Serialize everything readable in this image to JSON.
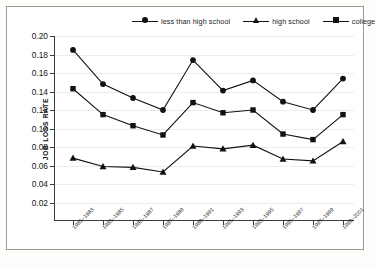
{
  "chart_data": {
    "type": "line",
    "title": "",
    "xlabel": "",
    "ylabel": "JOB LOSS RATE",
    "ylim": [
      0.0,
      0.2
    ],
    "yticks": [
      "0.02",
      "0.04",
      "0.06",
      "0.08",
      "0.10",
      "0.12",
      "0.14",
      "0.16",
      "0.18",
      "0.20"
    ],
    "ytick_values": [
      0.02,
      0.04,
      0.06,
      0.08,
      0.1,
      0.12,
      0.14,
      0.16,
      0.18,
      0.2
    ],
    "grid": true,
    "legend_position": "top",
    "categories": [
      "1981–1983",
      "1983–1985",
      "1985–1987",
      "1987–1989",
      "1989–1991",
      "1991–1993",
      "1993–1995",
      "1995–1997",
      "1997–1999",
      "1999–2001"
    ],
    "series": [
      {
        "name": "less than high school",
        "marker": "circle",
        "color": "#111111",
        "values": [
          0.185,
          0.148,
          0.133,
          0.12,
          0.174,
          0.141,
          0.152,
          0.129,
          0.12,
          0.154
        ]
      },
      {
        "name": "college",
        "marker": "square",
        "color": "#111111",
        "values": [
          0.143,
          0.115,
          0.103,
          0.093,
          0.128,
          0.117,
          0.12,
          0.094,
          0.088,
          0.115
        ]
      },
      {
        "name": "high school",
        "marker": "triangle",
        "color": "#111111",
        "values": [
          0.068,
          0.059,
          0.058,
          0.053,
          0.081,
          0.078,
          0.082,
          0.067,
          0.065,
          0.086
        ]
      }
    ]
  },
  "legend": {
    "items": [
      {
        "label": "less than high school",
        "marker": "circle"
      },
      {
        "label": "high school",
        "marker": "triangle"
      },
      {
        "label": "college",
        "marker": "square"
      }
    ]
  }
}
